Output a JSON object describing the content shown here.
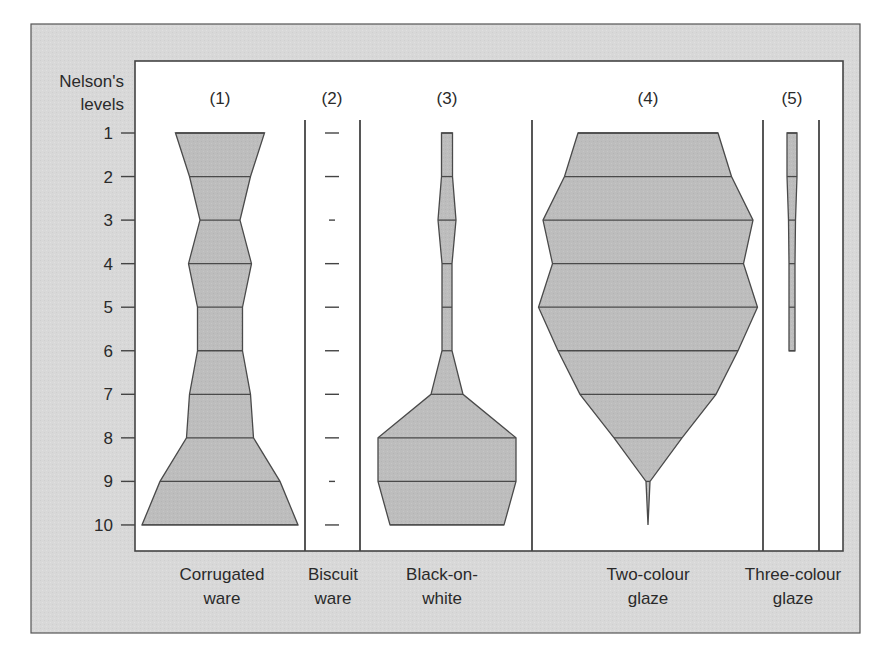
{
  "chart_data": {
    "type": "battleship",
    "title": "",
    "ylabel": "Nelson's levels",
    "y_ticks": [
      "1",
      "2",
      "3",
      "4",
      "5",
      "6",
      "7",
      "8",
      "9",
      "10"
    ],
    "y_direction": "top-to-bottom",
    "grid": false,
    "legend": null,
    "colors": {
      "panel": "#d9d9d9",
      "plot_bg": "#ffffff",
      "fill": "#bdbdbd",
      "stroke": "#4a4a4a"
    },
    "series": [
      {
        "id": "1",
        "label_number": "(1)",
        "name": "Corrugated ware",
        "name_lines": [
          "Corrugated",
          "ware"
        ],
        "relative_widths": [
          89,
          61,
          40,
          63,
          45,
          45,
          61,
          67,
          120,
          156
        ]
      },
      {
        "id": "2",
        "label_number": "(2)",
        "name": "Biscuit ware",
        "name_lines": [
          "Biscuit",
          "ware"
        ],
        "relative_widths": [
          1,
          1,
          0.5,
          1,
          1,
          1,
          1,
          1,
          0.5,
          1
        ],
        "style": "ticks"
      },
      {
        "id": "3",
        "label_number": "(3)",
        "name": "Black-on-white",
        "name_lines": [
          "Black-on-",
          "white"
        ],
        "relative_widths": [
          11,
          11,
          18,
          10,
          10,
          10,
          32,
          138,
          138,
          114
        ]
      },
      {
        "id": "4",
        "label_number": "(4)",
        "name": "Two-colour glaze",
        "name_lines": [
          "Two-colour",
          "glaze"
        ],
        "relative_widths": [
          140,
          167,
          210,
          191,
          219,
          180,
          136,
          68,
          4,
          0
        ]
      },
      {
        "id": "5",
        "label_number": "(5)",
        "name": "Three-colour glaze",
        "name_lines": [
          "Three-colour",
          "glaze"
        ],
        "relative_widths": [
          10,
          10,
          7,
          6,
          6,
          6,
          null,
          null,
          null,
          null
        ]
      }
    ]
  },
  "labels": {
    "ylabel_line1": "Nelson's",
    "ylabel_line2": "levels"
  }
}
